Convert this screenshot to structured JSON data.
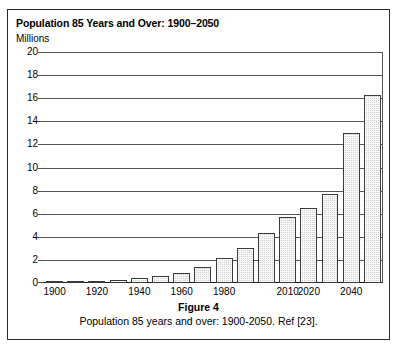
{
  "figure": {
    "chart_title": "Population 85 Years and Over: 1900–2050",
    "caption_number": "Figure 4",
    "caption_text": "Population 85 years and over: 1900-2050. Ref [23]."
  },
  "chart_data": {
    "type": "bar",
    "title": "Population 85 Years and Over: 1900–2050",
    "xlabel": "",
    "ylabel": "Millions",
    "ylim": [
      0,
      20
    ],
    "ytick_values": [
      0,
      2,
      4,
      6,
      8,
      10,
      12,
      14,
      16,
      18,
      20
    ],
    "ytick_labels": [
      "0",
      "2",
      "4",
      "6",
      "8",
      "10",
      "12",
      "14",
      "16",
      "18",
      "20"
    ],
    "grid": true,
    "legend": false,
    "categories": [
      "1900",
      "1910",
      "1920",
      "1930",
      "1940",
      "1950",
      "1960",
      "1970",
      "1980",
      "1990",
      "2000",
      "2010",
      "2020",
      "2030",
      "2040",
      "2050"
    ],
    "values": [
      0.1,
      0.2,
      0.2,
      0.3,
      0.4,
      0.6,
      0.9,
      1.4,
      2.2,
      3.0,
      4.3,
      5.7,
      6.5,
      7.7,
      13.0,
      16.3
    ],
    "xtick_labels_shown": [
      "1900",
      "1920",
      "1940",
      "1960",
      "1980",
      "2010",
      "2020",
      "2040"
    ],
    "xtick_label_categories": [
      "1900",
      "1920",
      "1940",
      "1960",
      "1980",
      "2010",
      "2020",
      "2040"
    ],
    "bar_fill_color": "#d2d2d2",
    "bar_edge_color": "#3a3a3a",
    "gridline_color": "#555555"
  }
}
